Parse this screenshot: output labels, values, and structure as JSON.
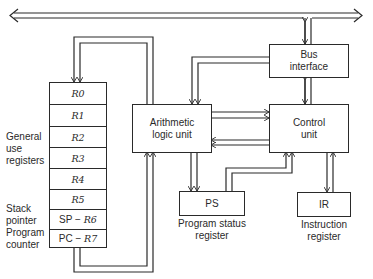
{
  "diagram": {
    "system_bus": {
      "name": "System bus"
    },
    "registers": {
      "rows": [
        {
          "prefix": "",
          "name": "R0"
        },
        {
          "prefix": "",
          "name": "R1"
        },
        {
          "prefix": "",
          "name": "R2"
        },
        {
          "prefix": "",
          "name": "R3"
        },
        {
          "prefix": "",
          "name": "R4"
        },
        {
          "prefix": "",
          "name": "R5"
        },
        {
          "prefix": "SP − ",
          "name": "R6"
        },
        {
          "prefix": "PC − ",
          "name": "R7"
        }
      ],
      "labels": {
        "general_use": [
          "General",
          "use",
          "registers"
        ],
        "stack_pointer": [
          "Stack",
          "pointer"
        ],
        "program_counter": [
          "Program",
          "counter"
        ]
      }
    },
    "alu": {
      "line1": "Arithmetic",
      "line2": "logic unit"
    },
    "bus_interface": {
      "line1": "Bus",
      "line2": "interface"
    },
    "control_unit": {
      "line1": "Control",
      "line2": "unit"
    },
    "ps": {
      "label": "PS",
      "caption1": "Program status",
      "caption2": "register"
    },
    "ir": {
      "label": "IR",
      "caption1": "Instruction",
      "caption2": "register"
    }
  }
}
